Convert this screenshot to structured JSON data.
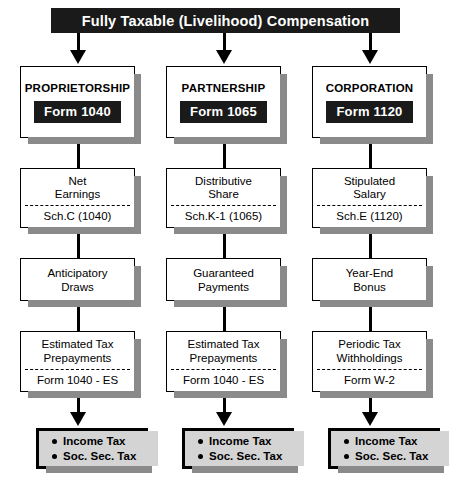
{
  "diagram": {
    "title": "Fully Taxable (Livelihood) Compensation",
    "columns": [
      {
        "entity": "PROPRIETORSHIP",
        "form_chip": "Form 1040",
        "income_title_line1": "Net",
        "income_title_line2": "Earnings",
        "income_schedule": "Sch.C (1040)",
        "draw_line1": "Anticipatory",
        "draw_line2": "Draws",
        "prepay_line1": "Estimated Tax",
        "prepay_line2": "Prepayments",
        "prepay_form": "Form 1040 - ES",
        "result_line1": "Income Tax",
        "result_line2": "Soc. Sec. Tax"
      },
      {
        "entity": "PARTNERSHIP",
        "form_chip": "Form 1065",
        "income_title_line1": "Distributive",
        "income_title_line2": "Share",
        "income_schedule": "Sch.K-1 (1065)",
        "draw_line1": "Guaranteed",
        "draw_line2": "Payments",
        "prepay_line1": "Estimated Tax",
        "prepay_line2": "Prepayments",
        "prepay_form": "Form 1040 - ES",
        "result_line1": "Income Tax",
        "result_line2": "Soc. Sec. Tax"
      },
      {
        "entity": "CORPORATION",
        "form_chip": "Form 1120",
        "income_title_line1": "Stipulated",
        "income_title_line2": "Salary",
        "income_schedule": "Sch.E (1120)",
        "draw_line1": "Year-End",
        "draw_line2": "Bonus",
        "prepay_line1": "Periodic Tax",
        "prepay_line2": "Withholdings",
        "prepay_form": "Form W-2",
        "result_line1": "Income Tax",
        "result_line2": "Soc. Sec. Tax"
      }
    ],
    "colors": {
      "header_bg": "#1a1a1a",
      "header_text": "#ffffff",
      "box_border": "#000000",
      "box_fill": "#ffffff",
      "shadow": "#8a8a8a",
      "result_fill": "#d4d4d4",
      "connector": "#000000"
    }
  }
}
